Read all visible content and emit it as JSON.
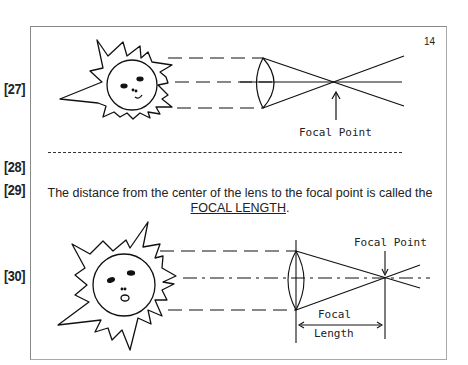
{
  "page": {
    "page_number": "14",
    "markers": [
      "[27]",
      "[28]",
      "[29]",
      "[30]"
    ]
  },
  "figure1": {
    "label": "Focal Point"
  },
  "paragraph": {
    "text": "The distance from the center of the lens to the focal point is called the",
    "term": "FOCAL LENGTH",
    "end": "."
  },
  "figure2": {
    "focal_point_label": "Focal Point",
    "focal_length_label_line1": "Focal",
    "focal_length_label_line2": "Length"
  }
}
